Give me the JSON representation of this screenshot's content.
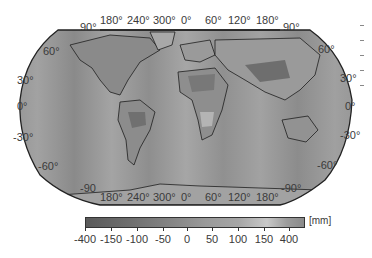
{
  "map": {
    "projection": "Robinson",
    "background_color": "#ffffff",
    "ocean_color": "#9a9a9a",
    "coastline_color": "#1e1e1e",
    "top_longitude_labels": [
      "90°",
      "180°",
      "240°",
      "300°",
      "0°",
      "60°",
      "120°",
      "180°",
      "90°"
    ],
    "bottom_longitude_labels": [
      "-90",
      "180°",
      "240°",
      "300°",
      "0°",
      "60°",
      "120°",
      "180°",
      "-90°"
    ],
    "left_latitude_labels": [
      "60°",
      "30°",
      "0°",
      "-30°",
      "-60°"
    ],
    "right_latitude_labels": [
      "60°",
      "30°",
      "0°",
      "-30°",
      "-60°"
    ]
  },
  "colorbar": {
    "unit": "[mm]",
    "ticks": [
      "-400",
      "-150",
      "-100",
      "-50",
      "0",
      "50",
      "100",
      "150",
      "400"
    ],
    "colors": [
      "#5a5a5a",
      "#6e6e6e",
      "#868686",
      "#9a9a9a",
      "#a6a6a6",
      "#c8c8c8",
      "#8a8a8a"
    ]
  }
}
